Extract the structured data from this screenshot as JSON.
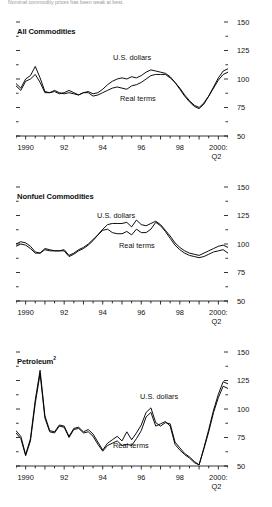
{
  "figure": {
    "top_note": "Nominal commodity prices has been weak at best.",
    "y_axis": {
      "labels": [
        "150",
        "125",
        "100",
        "75",
        "50"
      ],
      "min": 50,
      "max": 150,
      "major_step": 25,
      "minor_step": 12.5
    },
    "x_axis": {
      "labels": [
        "1990",
        "92",
        "94",
        "96",
        "98",
        "2000:"
      ],
      "last_label_line2": "Q2",
      "min": 1989.5,
      "max": 2000.5,
      "tick_step": 0.5
    },
    "series_names": {
      "nominal": "U.S. dollars",
      "real": "Real terms"
    }
  },
  "chart_data": [
    {
      "type": "line",
      "title": "All Commodities",
      "title_sup": "",
      "xlabel": "",
      "ylabel": "",
      "xlim": [
        1989.5,
        2000.5
      ],
      "ylim": [
        50,
        150
      ],
      "grid": false,
      "legend": "inline-annotation",
      "x": [
        1989.5,
        1989.75,
        1990,
        1990.25,
        1990.5,
        1990.75,
        1991,
        1991.25,
        1991.5,
        1991.75,
        1992,
        1992.25,
        1992.5,
        1992.75,
        1993,
        1993.25,
        1993.5,
        1993.75,
        1994,
        1994.25,
        1994.5,
        1994.75,
        1995,
        1995.25,
        1995.5,
        1995.75,
        1996,
        1996.25,
        1996.5,
        1996.75,
        1997,
        1997.25,
        1997.5,
        1997.75,
        1998,
        1998.25,
        1998.5,
        1998.75,
        1999,
        1999.25,
        1999.5,
        1999.75,
        2000,
        2000.25,
        2000.5
      ],
      "series": [
        {
          "name": "U.S. dollars",
          "values": [
            96,
            92,
            100,
            103,
            111,
            101,
            89,
            88,
            89,
            87,
            88,
            90,
            88,
            86,
            88,
            89,
            87,
            88,
            91,
            95,
            98,
            100,
            101,
            100,
            102,
            101,
            103,
            106,
            108,
            107,
            106,
            105,
            102,
            97,
            91,
            85,
            80,
            76,
            74,
            78,
            85,
            93,
            101,
            107,
            109
          ]
        },
        {
          "name": "Real terms",
          "values": [
            94,
            90,
            98,
            100,
            104,
            97,
            88,
            88,
            90,
            88,
            87,
            88,
            87,
            86,
            88,
            88,
            85,
            86,
            88,
            90,
            92,
            93,
            92,
            91,
            94,
            95,
            97,
            100,
            103,
            104,
            104,
            104,
            101,
            97,
            92,
            86,
            81,
            77,
            75,
            79,
            85,
            92,
            99,
            104,
            106
          ]
        }
      ]
    },
    {
      "type": "line",
      "title": "Nonfuel Commodities",
      "title_sup": "",
      "xlabel": "",
      "ylabel": "",
      "xlim": [
        1989.5,
        2000.5
      ],
      "ylim": [
        50,
        150
      ],
      "grid": false,
      "legend": "inline-annotation",
      "x": [
        1989.5,
        1989.75,
        1990,
        1990.25,
        1990.5,
        1990.75,
        1991,
        1991.25,
        1991.5,
        1991.75,
        1992,
        1992.25,
        1992.5,
        1992.75,
        1993,
        1993.25,
        1993.5,
        1993.75,
        1994,
        1994.25,
        1994.5,
        1994.75,
        1995,
        1995.25,
        1995.5,
        1995.75,
        1996,
        1996.25,
        1996.5,
        1996.75,
        1997,
        1997.25,
        1997.5,
        1997.75,
        1998,
        1998.25,
        1998.5,
        1998.75,
        1999,
        1999.25,
        1999.5,
        1999.75,
        2000,
        2000.25,
        2000.5
      ],
      "series": [
        {
          "name": "U.S. dollars",
          "values": [
            100,
            102,
            101,
            98,
            93,
            92,
            96,
            95,
            94,
            94,
            95,
            90,
            92,
            95,
            97,
            100,
            104,
            108,
            113,
            117,
            118,
            118,
            118,
            119,
            115,
            121,
            117,
            116,
            118,
            120,
            117,
            112,
            107,
            101,
            97,
            94,
            92,
            91,
            90,
            92,
            94,
            96,
            98,
            99,
            97
          ]
        },
        {
          "name": "Real terms",
          "values": [
            98,
            100,
            99,
            96,
            92,
            92,
            95,
            94,
            94,
            94,
            94,
            89,
            91,
            94,
            96,
            99,
            103,
            108,
            112,
            113,
            110,
            109,
            109,
            111,
            108,
            113,
            110,
            110,
            113,
            119,
            116,
            111,
            105,
            99,
            95,
            92,
            90,
            89,
            88,
            89,
            91,
            93,
            94,
            95,
            92
          ]
        }
      ]
    },
    {
      "type": "line",
      "title": "Petroleum",
      "title_sup": "2",
      "xlabel": "",
      "ylabel": "",
      "xlim": [
        1989.5,
        2000.5
      ],
      "ylim": [
        50,
        150
      ],
      "grid": false,
      "legend": "inline-annotation",
      "x": [
        1989.5,
        1989.75,
        1990,
        1990.25,
        1990.5,
        1990.75,
        1991,
        1991.25,
        1991.5,
        1991.75,
        1992,
        1992.25,
        1992.5,
        1992.75,
        1993,
        1993.25,
        1993.5,
        1993.75,
        1994,
        1994.25,
        1994.5,
        1994.75,
        1995,
        1995.25,
        1995.5,
        1995.75,
        1996,
        1996.25,
        1996.5,
        1996.75,
        1997,
        1997.25,
        1997.5,
        1997.75,
        1998,
        1998.25,
        1998.5,
        1998.75,
        1999,
        1999.25,
        1999.5,
        1999.75,
        2000,
        2000.25,
        2000.5
      ],
      "series": [
        {
          "name": "U.S. dollars",
          "values": [
            81,
            76,
            60,
            74,
            108,
            134,
            94,
            81,
            80,
            86,
            85,
            76,
            83,
            84,
            80,
            82,
            78,
            71,
            64,
            70,
            73,
            76,
            72,
            80,
            73,
            79,
            86,
            97,
            101,
            88,
            85,
            88,
            87,
            71,
            66,
            61,
            58,
            54,
            51,
            66,
            82,
            99,
            113,
            124,
            122
          ]
        },
        {
          "name": "Real terms",
          "values": [
            79,
            74,
            59,
            72,
            105,
            131,
            92,
            80,
            79,
            85,
            84,
            75,
            82,
            83,
            79,
            80,
            76,
            69,
            63,
            68,
            70,
            72,
            68,
            69,
            68,
            74,
            81,
            93,
            97,
            85,
            87,
            89,
            85,
            69,
            64,
            60,
            57,
            53,
            51,
            65,
            80,
            97,
            110,
            120,
            118
          ]
        }
      ]
    }
  ]
}
